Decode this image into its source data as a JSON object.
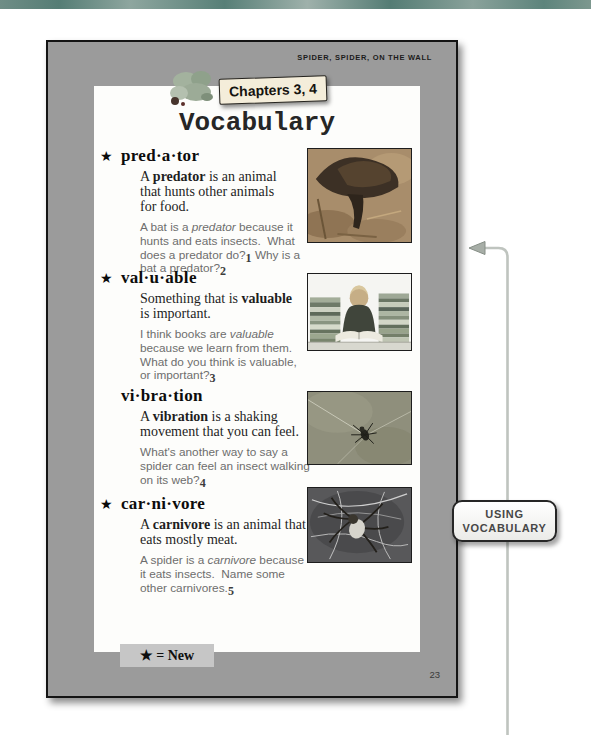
{
  "page": {
    "running_head": "SPIDER, SPIDER, ON THE WALL",
    "banner": "Chapters 3, 4",
    "title": "Vocabulary",
    "legend": "★ = New",
    "page_number": "23"
  },
  "sidebar_label": {
    "line1": "USING",
    "line2": "VOCABULARY"
  },
  "entries": [
    {
      "star": "★",
      "headword": "pred·a·tor",
      "def": {
        "pre": "A ",
        "bold": "predator",
        "post": " is an animal\nthat hunts other animals\nfor food."
      },
      "q": {
        "p1": "A bat is a ",
        "em": "predator",
        "p2": " because it\nhunts and eats insects.  What\ndoes a predator do?",
        "n1": "1",
        "p3": " Why is a\nbat a predator?",
        "n2": "2"
      }
    },
    {
      "star": "★",
      "headword": "val·u·able",
      "def": {
        "pre": "Something that is ",
        "bold": "valuable",
        "post": "\nis important."
      },
      "q": {
        "p1": "I think books are ",
        "em": "valuable",
        "p2": "\nbecause we learn from them.\nWhat do you think is valuable,\nor important?",
        "n1": "3",
        "p3": "",
        "n2": ""
      }
    },
    {
      "star": "",
      "headword": "vi·bra·tion",
      "def": {
        "pre": "A ",
        "bold": "vibration",
        "post": " is a shaking\nmovement that you can feel."
      },
      "q": {
        "p1": "",
        "em": "",
        "p2": "What's another way to say a\nspider can feel an insect walking\non its web?",
        "n1": "4",
        "p3": "",
        "n2": ""
      }
    },
    {
      "star": "★",
      "headword": "car·ni·vore",
      "def": {
        "pre": "A ",
        "bold": "carnivore",
        "post": " is an animal that\neats mostly meat."
      },
      "q": {
        "p1": "A spider is a ",
        "em": "carnivore",
        "p2": " because\nit eats insects.  Name some\nother carnivores.",
        "n1": "5",
        "p3": "",
        "n2": ""
      }
    }
  ],
  "photos": [
    {
      "name": "bat"
    },
    {
      "name": "boy-reading-with-book-stacks"
    },
    {
      "name": "spider-on-web"
    },
    {
      "name": "spider-in-dark-web"
    }
  ],
  "colors": {
    "top_bar_teal": "#5d837b",
    "page_gray": "#9b9b9b",
    "banner_bg": "#f4edda",
    "legend_bg": "#c6c6c6",
    "connector_line": "#bfc4bf",
    "photo_border": "#1d1d1d"
  }
}
